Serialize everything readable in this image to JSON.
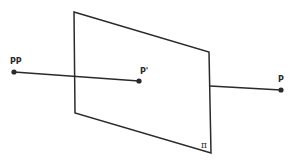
{
  "diagram": {
    "stroke_color": "#2a2a2a",
    "background": "#ffffff",
    "plane": {
      "label": "π",
      "corners": [
        [
          74,
          12
        ],
        [
          209,
          52
        ],
        [
          211,
          153
        ],
        [
          75,
          113
        ]
      ]
    },
    "points": [
      {
        "id": "PP",
        "label": "PP",
        "x": 14,
        "y": 72
      },
      {
        "id": "P_prime",
        "label": "P'",
        "x": 139,
        "y": 81
      },
      {
        "id": "P",
        "label": "P",
        "x": 281,
        "y": 90
      }
    ],
    "segments": [
      {
        "from": "PP",
        "to": "P_prime",
        "note": "passes behind/through plane"
      },
      {
        "from": "plane_right_edge",
        "to": "P",
        "start": [
          210,
          86
        ]
      }
    ]
  }
}
